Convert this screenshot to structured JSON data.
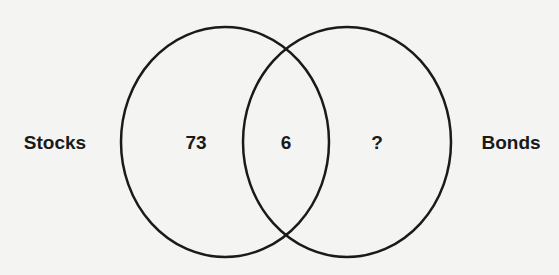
{
  "diagram": {
    "type": "venn",
    "sets": [
      {
        "name": "Stocks",
        "only_value": "73"
      },
      {
        "name": "Bonds",
        "only_value": "?"
      }
    ],
    "intersection_value": "6",
    "colors": {
      "stroke": "#1a1a1a",
      "background": "#f4f4f2"
    }
  }
}
